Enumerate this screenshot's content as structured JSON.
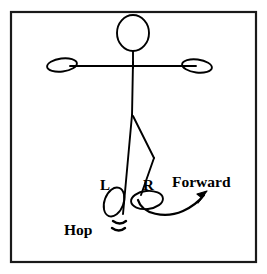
{
  "diagram": {
    "title_text": "",
    "background_color": "#ffffff",
    "ink_color": "#000000",
    "border": {
      "name": "frame-border",
      "x": 11,
      "y": 12,
      "width": 245,
      "height": 250,
      "stroke_width": 2.2
    },
    "labels": {
      "left_foot": "L",
      "right_foot": "R",
      "hop": "Hop",
      "forward": "Forward"
    },
    "figure": {
      "head": {
        "cx": 133,
        "cy": 33,
        "rx": 16,
        "ry": 18
      },
      "neck": {
        "x1": 133,
        "y1": 51,
        "x2": 133,
        "y2": 67
      },
      "spine": {
        "x1": 133,
        "y1": 52,
        "x2": 132,
        "y2": 116
      },
      "arms": {
        "x1": 68,
        "y1": 66,
        "x2": 198,
        "y2": 66
      },
      "left_hand": {
        "cx": 62,
        "cy": 65,
        "rx": 15,
        "ry": 6.5,
        "rotate": -8
      },
      "right_hand": {
        "cx": 196,
        "cy": 66,
        "rx": 15,
        "ry": 6.5,
        "rotate": 8
      },
      "left_leg": {
        "x1": 132,
        "y1": 115,
        "x2": 123,
        "y2": 213
      },
      "right_leg_thigh": {
        "x1": 133,
        "y1": 115,
        "x2": 153,
        "y2": 158
      },
      "right_leg_shin": {
        "x1": 153,
        "y1": 158,
        "x2": 141,
        "y2": 196
      },
      "left_foot_shape": {
        "cx": 114,
        "cy": 202,
        "rx": 9.5,
        "ry": 15,
        "rotate": 22
      },
      "right_foot_shape": {
        "cx": 146,
        "cy": 200,
        "rx": 16,
        "ry": 9,
        "rotate": -6
      }
    },
    "hop_marks": {
      "name": "hop-motion-lines",
      "count": 2,
      "x": 112,
      "y": 220
    },
    "forward_arrow": {
      "name": "forward-arrow",
      "start": [
        138,
        201
      ],
      "end": [
        206,
        193
      ],
      "direction": "up-right"
    },
    "label_positions": {
      "left_foot": [
        99,
        190
      ],
      "right_foot": [
        142,
        190
      ],
      "hop": [
        64,
        235
      ],
      "forward": [
        172,
        187
      ]
    }
  }
}
